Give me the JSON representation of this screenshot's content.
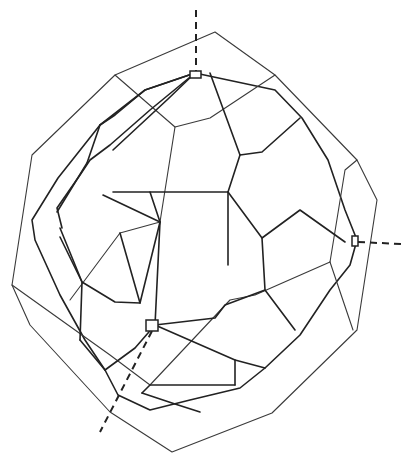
{
  "figure": {
    "type": "crystal-morphology-line-drawing",
    "colors": {
      "line": "#222222",
      "background": "#ffffff"
    },
    "outer_outline": [
      [
        115,
        75
      ],
      [
        215,
        32
      ],
      [
        275,
        75
      ],
      [
        357,
        160
      ],
      [
        377,
        200
      ],
      [
        357,
        330
      ],
      [
        272,
        413
      ],
      [
        172,
        452
      ],
      [
        110,
        412
      ],
      [
        30,
        325
      ],
      [
        12,
        285
      ],
      [
        32,
        155
      ],
      [
        115,
        75
      ]
    ],
    "inner_outline": [
      [
        195,
        73
      ],
      [
        275,
        90
      ],
      [
        302,
        118
      ],
      [
        328,
        160
      ],
      [
        345,
        210
      ],
      [
        357,
        240
      ],
      [
        350,
        265
      ],
      [
        330,
        290
      ],
      [
        300,
        335
      ],
      [
        265,
        368
      ],
      [
        240,
        388
      ],
      [
        190,
        400
      ],
      [
        150,
        410
      ],
      [
        118,
        395
      ],
      [
        105,
        370
      ],
      [
        85,
        340
      ],
      [
        60,
        295
      ],
      [
        35,
        240
      ],
      [
        32,
        220
      ],
      [
        58,
        178
      ],
      [
        100,
        125
      ],
      [
        145,
        90
      ],
      [
        195,
        73
      ]
    ],
    "thick_edges": [
      [
        [
          195,
          73
        ],
        [
          145,
          90
        ],
        [
          115,
          115
        ],
        [
          100,
          125
        ]
      ],
      [
        [
          195,
          73
        ],
        [
          150,
          110
        ],
        [
          110,
          145
        ],
        [
          90,
          160
        ],
        [
          80,
          175
        ],
        [
          57,
          208
        ],
        [
          62,
          228
        ]
      ],
      [
        [
          195,
          73
        ],
        [
          168,
          99
        ],
        [
          113,
          150
        ]
      ],
      [
        [
          100,
          125
        ],
        [
          87,
          163
        ]
      ],
      [
        [
          87,
          163
        ],
        [
          57,
          212
        ]
      ],
      [
        [
          210,
          73
        ],
        [
          240,
          155
        ],
        [
          262,
          152
        ],
        [
          300,
          118
        ]
      ],
      [
        [
          240,
          155
        ],
        [
          228,
          192
        ],
        [
          228,
          192
        ],
        [
          228,
          265
        ]
      ],
      [
        [
          228,
          192
        ],
        [
          262,
          238
        ],
        [
          300,
          210
        ],
        [
          345,
          242
        ]
      ],
      [
        [
          228,
          192
        ],
        [
          150,
          192
        ],
        [
          113,
          192
        ]
      ],
      [
        [
          150,
          192
        ],
        [
          160,
          222
        ],
        [
          140,
          303
        ],
        [
          115,
          302
        ],
        [
          82,
          282
        ],
        [
          60,
          237
        ]
      ],
      [
        [
          160,
          222
        ],
        [
          103,
          195
        ]
      ],
      [
        [
          120,
          233
        ],
        [
          140,
          303
        ]
      ],
      [
        [
          262,
          238
        ],
        [
          265,
          290
        ],
        [
          295,
          330
        ]
      ],
      [
        [
          265,
          290
        ],
        [
          225,
          305
        ],
        [
          215,
          318
        ],
        [
          155,
          325
        ]
      ],
      [
        [
          160,
          222
        ],
        [
          155,
          325
        ]
      ],
      [
        [
          155,
          325
        ],
        [
          135,
          348
        ],
        [
          105,
          370
        ]
      ],
      [
        [
          155,
          325
        ],
        [
          235,
          360
        ],
        [
          235,
          385
        ]
      ],
      [
        [
          235,
          360
        ],
        [
          265,
          368
        ]
      ],
      [
        [
          235,
          385
        ],
        [
          150,
          385
        ],
        [
          142,
          393
        ]
      ],
      [
        [
          142,
          393
        ],
        [
          175,
          404
        ],
        [
          200,
          412
        ]
      ],
      [
        [
          60,
          228
        ],
        [
          82,
          282
        ],
        [
          80,
          340
        ]
      ],
      [
        [
          80,
          340
        ],
        [
          105,
          370
        ]
      ]
    ],
    "thin_edges": [
      [
        [
          115,
          75
        ],
        [
          175,
          127
        ],
        [
          210,
          118
        ],
        [
          275,
          75
        ]
      ],
      [
        [
          12,
          285
        ],
        [
          110,
          355
        ],
        [
          150,
          385
        ]
      ],
      [
        [
          150,
          385
        ],
        [
          230,
          300
        ],
        [
          255,
          295
        ],
        [
          330,
          262
        ]
      ],
      [
        [
          330,
          262
        ],
        [
          345,
          170
        ],
        [
          357,
          160
        ]
      ],
      [
        [
          330,
          262
        ],
        [
          353,
          330
        ]
      ],
      [
        [
          70,
          300
        ],
        [
          120,
          233
        ],
        [
          160,
          222
        ]
      ],
      [
        [
          175,
          127
        ],
        [
          160,
          222
        ]
      ]
    ],
    "small_facets": [
      {
        "name": "top-facet",
        "x": 190,
        "y": 71,
        "w": 11,
        "h": 7
      },
      {
        "name": "front-facet",
        "x": 146,
        "y": 320,
        "w": 12,
        "h": 11
      },
      {
        "name": "right-facet",
        "x": 352,
        "y": 236,
        "w": 6,
        "h": 10
      }
    ],
    "axes": [
      {
        "name": "c-axis-vertical",
        "from": [
          196,
          10
        ],
        "to": [
          196,
          71
        ]
      },
      {
        "name": "b-axis-horizontal",
        "from": [
          358,
          242
        ],
        "to": [
          401,
          244
        ]
      },
      {
        "name": "a-axis-front",
        "from": [
          152,
          331
        ],
        "to": [
          100,
          432
        ]
      }
    ]
  }
}
